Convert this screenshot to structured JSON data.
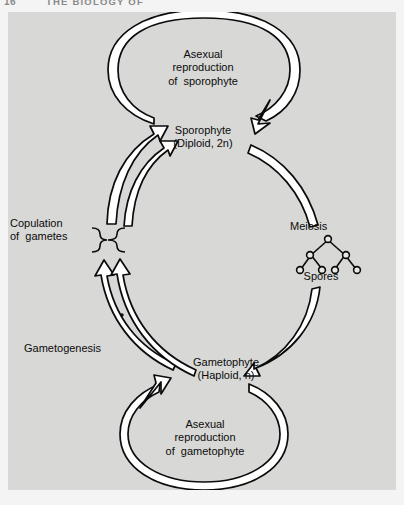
{
  "page": {
    "folio": "16",
    "running_head": "THE BIOLOGY OF",
    "background_color": "#f4f4f4",
    "panel_color": "#d8d8d6",
    "ink_color": "#0b0b0b"
  },
  "figure": {
    "labels": {
      "asexual_sporophyte": "Asexual\nreproduction\nof  sporophyte",
      "sporophyte": "Sporophyte\n(Diploid, 2n)",
      "meiosis": "Meiosis",
      "spores": "Spores",
      "copulation": "Copulation\nof  gametes",
      "gametogenesis": "Gametogenesis",
      "gametophyte": "Gametophyte\n(Haploid, n)",
      "asexual_gametophyte": "Asexual\nreproduction\nof  gametophyte"
    },
    "nodes": [
      {
        "id": "sporophyte",
        "label": "Sporophyte (Diploid, 2n)",
        "ploidy": "2n",
        "stage": "diploid"
      },
      {
        "id": "gametophyte",
        "label": "Gametophyte (Haploid, n)",
        "ploidy": "n",
        "stage": "haploid"
      },
      {
        "id": "spores",
        "label": "Spores",
        "ploidy": "n",
        "stage": "haploid"
      }
    ],
    "arrows": [
      {
        "id": "asexual-sporophyte-loop",
        "from": "sporophyte",
        "to": "sporophyte",
        "label": "Asexual reproduction of sporophyte",
        "shape": "circle-loop",
        "direction": "clockwise"
      },
      {
        "id": "meiosis-arc",
        "from": "sporophyte",
        "to": "spores",
        "label": "Meiosis",
        "shape": "arc",
        "direction": "down-right"
      },
      {
        "id": "spore-germination-arc",
        "from": "spores",
        "to": "gametophyte",
        "label": "",
        "shape": "arc",
        "direction": "down-left"
      },
      {
        "id": "asexual-gametophyte-loop",
        "from": "gametophyte",
        "to": "gametophyte",
        "label": "Asexual reproduction of gametophyte",
        "shape": "circle-loop",
        "direction": "clockwise"
      },
      {
        "id": "gametogenesis-arc-a",
        "from": "gametophyte",
        "to": "gametes",
        "label": "Gametogenesis",
        "shape": "arc",
        "direction": "up-left"
      },
      {
        "id": "gametogenesis-arc-b",
        "from": "gametophyte",
        "to": "gametes",
        "label": "",
        "shape": "arc",
        "direction": "up-left"
      },
      {
        "id": "fertilization-arc",
        "from": "gametes",
        "to": "sporophyte",
        "label": "Copulation of gametes",
        "shape": "arc",
        "direction": "up-right"
      }
    ],
    "meiosis_tree": {
      "label_top": "Meiosis",
      "label_bottom": "Spores",
      "levels": [
        1,
        2,
        4
      ],
      "node_count": 7,
      "node_shape": "open-circle"
    },
    "brace": {
      "id": "gamete-brace",
      "orientation": "up",
      "attached_label": "Copulation of gametes"
    },
    "marks": [
      {
        "id": "asterisk-mark",
        "glyph": "•"
      }
    ]
  }
}
